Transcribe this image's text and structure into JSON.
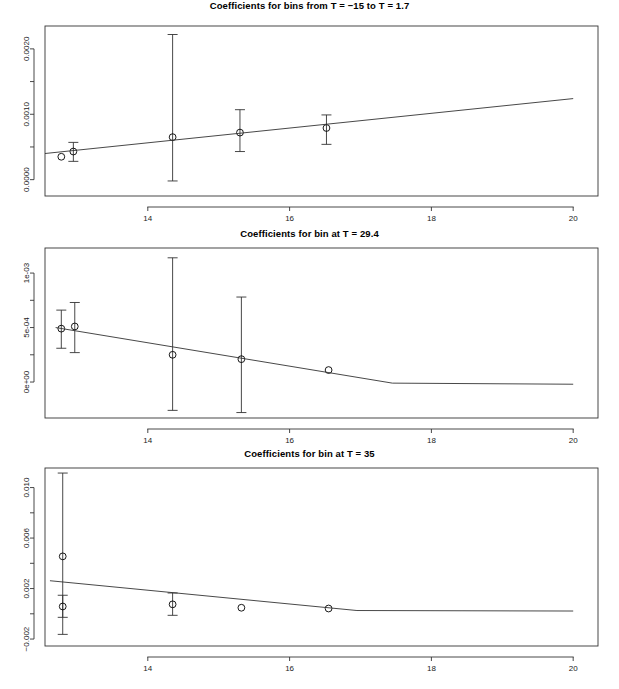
{
  "figure": {
    "background": "#ffffff",
    "line_color": "#333333",
    "point_color": "#000000",
    "panel_count": 3
  },
  "chart_data": [
    {
      "type": "scatter",
      "title": "Coefficients for bins from T = −15 to T = 1.7",
      "xlabel": "",
      "ylabel": "",
      "xlim": [
        12.55,
        20.35
      ],
      "ylim": [
        -0.00025,
        0.00235
      ],
      "grid": false,
      "legend": null,
      "xticks": [
        14,
        16,
        18,
        20
      ],
      "xtick_labels": [
        "14",
        "16",
        "18",
        "20"
      ],
      "xminor_ticks": [
        13,
        15,
        17,
        19
      ],
      "yticks": [
        0.0,
        0.001,
        0.002
      ],
      "ytick_labels": [
        "0.0000",
        "0.0010",
        "0.0020"
      ],
      "yminor_ticks": [
        0.0005,
        0.0015
      ],
      "series": [
        {
          "name": "point estimates",
          "points": [
            {
              "x": 12.78,
              "y": 0.00035,
              "ylo": 0.00035,
              "yhi": 0.00035
            },
            {
              "x": 12.95,
              "y": 0.00043,
              "ylo": 0.00028,
              "yhi": 0.00057
            },
            {
              "x": 14.35,
              "y": 0.00065,
              "ylo": -2e-05,
              "yhi": 0.00222
            },
            {
              "x": 15.3,
              "y": 0.00072,
              "ylo": 0.00043,
              "yhi": 0.00107
            },
            {
              "x": 16.52,
              "y": 0.00079,
              "ylo": 0.00054,
              "yhi": 0.00099
            }
          ]
        },
        {
          "name": "fitted line",
          "vertices": [
            {
              "x": 12.55,
              "y": 0.0004
            },
            {
              "x": 20.0,
              "y": 0.00124
            }
          ]
        }
      ]
    },
    {
      "type": "scatter",
      "title": "Coefficients for bin at T = 29.4",
      "xlabel": "",
      "ylabel": "",
      "xlim": [
        12.55,
        20.35
      ],
      "ylim": [
        -0.00033,
        0.00123
      ],
      "grid": false,
      "legend": null,
      "xticks": [
        14,
        16,
        18,
        20
      ],
      "xtick_labels": [
        "14",
        "16",
        "18",
        "20"
      ],
      "xminor_ticks": [
        13,
        15,
        17,
        19
      ],
      "yticks": [
        0.0,
        0.0005,
        0.001
      ],
      "ytick_labels": [
        "0e+00",
        "5e-04",
        "1e-03"
      ],
      "yminor_ticks": [
        0.00025,
        0.00075
      ],
      "series": [
        {
          "name": "point estimates",
          "points": [
            {
              "x": 12.78,
              "y": 0.00049,
              "ylo": 0.00031,
              "yhi": 0.00066
            },
            {
              "x": 12.97,
              "y": 0.00051,
              "ylo": 0.00027,
              "yhi": 0.00073
            },
            {
              "x": 14.35,
              "y": 0.00025,
              "ylo": -0.00026,
              "yhi": 0.00114
            },
            {
              "x": 15.32,
              "y": 0.00021,
              "ylo": -0.00028,
              "yhi": 0.00078
            },
            {
              "x": 16.55,
              "y": 0.00011,
              "ylo": 0.00011,
              "yhi": 0.00011
            }
          ]
        },
        {
          "name": "fitted line",
          "vertices": [
            {
              "x": 12.7,
              "y": 0.0005
            },
            {
              "x": 17.45,
              "y": -1e-05
            },
            {
              "x": 20.0,
              "y": -2e-05
            }
          ]
        }
      ]
    },
    {
      "type": "scatter",
      "title": "Coefficients for bin at T = 35",
      "xlabel": "",
      "ylabel": "",
      "xlim": [
        12.55,
        20.35
      ],
      "ylim": [
        -0.00255,
        0.01155
      ],
      "grid": false,
      "legend": null,
      "xticks": [
        14,
        16,
        18,
        20
      ],
      "xtick_labels": [
        "14",
        "16",
        "18",
        "20"
      ],
      "xminor_ticks": [
        13,
        15,
        17,
        19
      ],
      "yticks": [
        -0.002,
        0.002,
        0.006,
        0.01
      ],
      "ytick_labels": [
        "−0.002",
        "0.002",
        "0.006",
        "0.010"
      ],
      "yminor_ticks": [
        0.0,
        0.004,
        0.008
      ],
      "series": [
        {
          "name": "point estimates",
          "points": [
            {
              "x": 12.8,
              "y": 0.00455,
              "ylo": -0.00163,
              "yhi": 0.01115
            },
            {
              "x": 12.8,
              "y": 0.00058,
              "ylo": -0.00028,
              "yhi": 0.00147
            },
            {
              "x": 14.35,
              "y": 0.00075,
              "ylo": -0.00012,
              "yhi": 0.00165
            },
            {
              "x": 15.32,
              "y": 0.00048,
              "ylo": 0.00048,
              "yhi": 0.00048
            },
            {
              "x": 16.55,
              "y": 0.00042,
              "ylo": 0.00042,
              "yhi": 0.00042
            }
          ]
        },
        {
          "name": "fitted line",
          "vertices": [
            {
              "x": 12.62,
              "y": 0.00262
            },
            {
              "x": 16.95,
              "y": 0.00026
            },
            {
              "x": 20.0,
              "y": 0.00022
            }
          ]
        }
      ]
    }
  ]
}
